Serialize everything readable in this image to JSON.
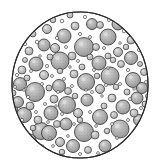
{
  "figure": {
    "kind": "micrograph-illustration",
    "background_color": "#ffffff",
    "canvas": {
      "width": 158,
      "height": 168
    }
  },
  "field": {
    "shape": "circle",
    "center_x": 80,
    "center_y": 85,
    "radius_x": 68,
    "radius_y": 73,
    "outline_color": "#2b2b2b",
    "outline_width": 1.1,
    "fill_color": "#ffffff"
  },
  "particle_style": {
    "fill_light": "#c9c9c9",
    "fill_mid": "#b0b0b0",
    "fill_dark": "#9a9a9a",
    "outline_color": "#3a3a3a",
    "outline_width": 0.8,
    "ring_outline_color": "#4a4a4a",
    "highlight_color": "#e8e8e8",
    "stipple_color": "#7d7d7d"
  },
  "chart_data": {
    "type": "scatter",
    "xlabel": "",
    "ylabel": "",
    "xlim": [
      12,
      150
    ],
    "ylim": [
      12,
      158
    ],
    "grid": false,
    "legend": null,
    "counts": {
      "large": 34,
      "medium": 58,
      "small_rings": 62,
      "total": 154
    },
    "series": [
      {
        "name": "large-particles",
        "shade": "mid",
        "points": [
          {
            "x": 84,
            "y": 47,
            "r": 9.5
          },
          {
            "x": 60,
            "y": 61,
            "r": 9.0
          },
          {
            "x": 110,
            "y": 76,
            "r": 9.0
          },
          {
            "x": 35,
            "y": 92,
            "r": 9.5
          },
          {
            "x": 86,
            "y": 82,
            "r": 8.5
          },
          {
            "x": 84,
            "y": 132,
            "r": 9.5
          },
          {
            "x": 120,
            "y": 129,
            "r": 9.0
          },
          {
            "x": 41,
            "y": 131,
            "r": 8.5
          },
          {
            "x": 108,
            "y": 37,
            "r": 8.0
          },
          {
            "x": 67,
            "y": 105,
            "r": 8.5
          },
          {
            "x": 49,
            "y": 133,
            "r": 7.5
          },
          {
            "x": 100,
            "y": 117,
            "r": 7.5
          },
          {
            "x": 133,
            "y": 80,
            "r": 7.5
          },
          {
            "x": 24,
            "y": 115,
            "r": 7.5
          },
          {
            "x": 99,
            "y": 63,
            "r": 7.0
          },
          {
            "x": 64,
            "y": 36,
            "r": 7.0
          },
          {
            "x": 36,
            "y": 64,
            "r": 7.0
          },
          {
            "x": 123,
            "y": 107,
            "r": 7.0
          },
          {
            "x": 51,
            "y": 113,
            "r": 7.0
          },
          {
            "x": 131,
            "y": 58,
            "r": 6.5
          },
          {
            "x": 20,
            "y": 84,
            "r": 6.5
          },
          {
            "x": 73,
            "y": 146,
            "r": 6.5
          },
          {
            "x": 105,
            "y": 146,
            "r": 6.0
          },
          {
            "x": 59,
            "y": 86,
            "r": 6.5
          },
          {
            "x": 87,
            "y": 100,
            "r": 6.0
          },
          {
            "x": 44,
            "y": 45,
            "r": 6.0
          },
          {
            "x": 118,
            "y": 24,
            "r": 6.0
          },
          {
            "x": 137,
            "y": 98,
            "r": 6.0
          },
          {
            "x": 30,
            "y": 140,
            "r": 6.0
          },
          {
            "x": 142,
            "y": 88,
            "r": 5.5
          },
          {
            "x": 92,
            "y": 24,
            "r": 5.5
          },
          {
            "x": 18,
            "y": 102,
            "r": 5.5
          },
          {
            "x": 66,
            "y": 124,
            "r": 6.0
          },
          {
            "x": 139,
            "y": 120,
            "r": 5.5
          }
        ]
      },
      {
        "name": "medium-particles",
        "shade": "light",
        "points": [
          {
            "x": 47,
            "y": 29,
            "r": 4.5
          },
          {
            "x": 75,
            "y": 26,
            "r": 4.0
          },
          {
            "x": 100,
            "y": 25,
            "r": 3.5
          },
          {
            "x": 131,
            "y": 40,
            "r": 4.0
          },
          {
            "x": 29,
            "y": 51,
            "r": 4.0
          },
          {
            "x": 55,
            "y": 48,
            "r": 4.5
          },
          {
            "x": 72,
            "y": 56,
            "r": 4.0
          },
          {
            "x": 96,
            "y": 47,
            "r": 3.5
          },
          {
            "x": 118,
            "y": 52,
            "r": 4.5
          },
          {
            "x": 22,
            "y": 70,
            "r": 4.0
          },
          {
            "x": 44,
            "y": 75,
            "r": 4.5
          },
          {
            "x": 74,
            "y": 74,
            "r": 4.0
          },
          {
            "x": 100,
            "y": 89,
            "r": 4.5
          },
          {
            "x": 121,
            "y": 64,
            "r": 3.5
          },
          {
            "x": 144,
            "y": 72,
            "r": 3.5
          },
          {
            "x": 30,
            "y": 106,
            "r": 4.0
          },
          {
            "x": 54,
            "y": 99,
            "r": 4.0
          },
          {
            "x": 78,
            "y": 113,
            "r": 4.5
          },
          {
            "x": 112,
            "y": 98,
            "r": 4.0
          },
          {
            "x": 134,
            "y": 113,
            "r": 4.0
          },
          {
            "x": 20,
            "y": 127,
            "r": 4.0
          },
          {
            "x": 57,
            "y": 124,
            "r": 3.5
          },
          {
            "x": 95,
            "y": 135,
            "r": 4.0
          },
          {
            "x": 129,
            "y": 141,
            "r": 4.0
          },
          {
            "x": 60,
            "y": 142,
            "r": 4.5
          },
          {
            "x": 41,
            "y": 148,
            "r": 3.5
          },
          {
            "x": 114,
            "y": 115,
            "r": 3.5
          },
          {
            "x": 90,
            "y": 57,
            "r": 3.0
          },
          {
            "x": 38,
            "y": 120,
            "r": 4.0
          },
          {
            "x": 68,
            "y": 91,
            "r": 3.5
          },
          {
            "x": 108,
            "y": 56,
            "r": 3.0
          },
          {
            "x": 27,
            "y": 78,
            "r": 3.0
          },
          {
            "x": 50,
            "y": 57,
            "r": 3.0
          },
          {
            "x": 82,
            "y": 67,
            "r": 3.0
          },
          {
            "x": 127,
            "y": 92,
            "r": 3.0
          },
          {
            "x": 70,
            "y": 15,
            "r": 3.0
          },
          {
            "x": 145,
            "y": 104,
            "r": 3.0
          },
          {
            "x": 13,
            "y": 93,
            "r": 3.0
          },
          {
            "x": 88,
            "y": 150,
            "r": 3.5
          },
          {
            "x": 113,
            "y": 60,
            "r": 2.8
          },
          {
            "x": 33,
            "y": 34,
            "r": 3.0
          },
          {
            "x": 143,
            "y": 131,
            "r": 3.0
          },
          {
            "x": 49,
            "y": 88,
            "r": 3.0
          },
          {
            "x": 75,
            "y": 96,
            "r": 2.8
          },
          {
            "x": 104,
            "y": 106,
            "r": 3.0
          },
          {
            "x": 60,
            "y": 71,
            "r": 2.8
          },
          {
            "x": 126,
            "y": 47,
            "r": 2.8
          },
          {
            "x": 15,
            "y": 110,
            "r": 2.8
          },
          {
            "x": 53,
            "y": 20,
            "r": 2.8
          },
          {
            "x": 97,
            "y": 76,
            "r": 2.8
          },
          {
            "x": 33,
            "y": 128,
            "r": 2.8
          },
          {
            "x": 116,
            "y": 87,
            "r": 2.8
          },
          {
            "x": 140,
            "y": 64,
            "r": 2.5
          },
          {
            "x": 62,
            "y": 152,
            "r": 2.8
          },
          {
            "x": 25,
            "y": 60,
            "r": 2.5
          },
          {
            "x": 80,
            "y": 120,
            "r": 2.8
          },
          {
            "x": 148,
            "y": 96,
            "r": 2.5
          },
          {
            "x": 107,
            "y": 131,
            "r": 2.8
          }
        ]
      },
      {
        "name": "small-rings",
        "shade": "open",
        "points": [
          {
            "x": 62,
            "y": 21,
            "r": 1.8
          },
          {
            "x": 85,
            "y": 17,
            "r": 1.6
          },
          {
            "x": 109,
            "y": 20,
            "r": 1.6
          },
          {
            "x": 37,
            "y": 42,
            "r": 1.8
          },
          {
            "x": 57,
            "y": 38,
            "r": 1.6
          },
          {
            "x": 80,
            "y": 34,
            "r": 1.6
          },
          {
            "x": 124,
            "y": 31,
            "r": 1.8
          },
          {
            "x": 139,
            "y": 50,
            "r": 1.6
          },
          {
            "x": 25,
            "y": 44,
            "r": 1.6
          },
          {
            "x": 17,
            "y": 75,
            "r": 1.6
          },
          {
            "x": 31,
            "y": 71,
            "r": 1.5
          },
          {
            "x": 47,
            "y": 66,
            "r": 1.6
          },
          {
            "x": 66,
            "y": 47,
            "r": 1.5
          },
          {
            "x": 90,
            "y": 37,
            "r": 1.5
          },
          {
            "x": 104,
            "y": 48,
            "r": 1.5
          },
          {
            "x": 128,
            "y": 70,
            "r": 1.6
          },
          {
            "x": 146,
            "y": 82,
            "r": 1.5
          },
          {
            "x": 15,
            "y": 87,
            "r": 1.5
          },
          {
            "x": 28,
            "y": 97,
            "r": 1.6
          },
          {
            "x": 42,
            "y": 84,
            "r": 1.5
          },
          {
            "x": 52,
            "y": 76,
            "r": 1.5
          },
          {
            "x": 64,
            "y": 79,
            "r": 1.5
          },
          {
            "x": 78,
            "y": 61,
            "r": 1.5
          },
          {
            "x": 94,
            "y": 70,
            "r": 1.5
          },
          {
            "x": 120,
            "y": 84,
            "r": 1.5
          },
          {
            "x": 141,
            "y": 108,
            "r": 1.5
          },
          {
            "x": 22,
            "y": 120,
            "r": 1.6
          },
          {
            "x": 36,
            "y": 112,
            "r": 1.5
          },
          {
            "x": 45,
            "y": 104,
            "r": 1.5
          },
          {
            "x": 58,
            "y": 92,
            "r": 1.5
          },
          {
            "x": 72,
            "y": 86,
            "r": 1.5
          },
          {
            "x": 92,
            "y": 92,
            "r": 1.5
          },
          {
            "x": 106,
            "y": 85,
            "r": 1.5
          },
          {
            "x": 130,
            "y": 99,
            "r": 1.5
          },
          {
            "x": 16,
            "y": 118,
            "r": 1.4
          },
          {
            "x": 27,
            "y": 133,
            "r": 1.5
          },
          {
            "x": 48,
            "y": 122,
            "r": 1.4
          },
          {
            "x": 62,
            "y": 114,
            "r": 1.5
          },
          {
            "x": 74,
            "y": 124,
            "r": 1.4
          },
          {
            "x": 90,
            "y": 112,
            "r": 1.5
          },
          {
            "x": 112,
            "y": 124,
            "r": 1.5
          },
          {
            "x": 128,
            "y": 120,
            "r": 1.5
          },
          {
            "x": 137,
            "y": 130,
            "r": 1.4
          },
          {
            "x": 35,
            "y": 143,
            "r": 1.5
          },
          {
            "x": 53,
            "y": 146,
            "r": 1.4
          },
          {
            "x": 68,
            "y": 136,
            "r": 1.4
          },
          {
            "x": 96,
            "y": 126,
            "r": 1.4
          },
          {
            "x": 117,
            "y": 138,
            "r": 1.4
          },
          {
            "x": 80,
            "y": 154,
            "r": 1.5
          },
          {
            "x": 98,
            "y": 153,
            "r": 1.4
          },
          {
            "x": 115,
            "y": 149,
            "r": 1.4
          },
          {
            "x": 50,
            "y": 138,
            "r": 1.3
          },
          {
            "x": 24,
            "y": 90,
            "r": 1.3
          },
          {
            "x": 40,
            "y": 56,
            "r": 1.3
          },
          {
            "x": 70,
            "y": 67,
            "r": 1.3
          },
          {
            "x": 86,
            "y": 90,
            "r": 1.3
          },
          {
            "x": 102,
            "y": 96,
            "r": 1.3
          },
          {
            "x": 134,
            "y": 89,
            "r": 1.3
          },
          {
            "x": 144,
            "y": 116,
            "r": 1.3
          },
          {
            "x": 56,
            "y": 106,
            "r": 1.3
          },
          {
            "x": 108,
            "y": 68,
            "r": 1.3
          },
          {
            "x": 120,
            "y": 43,
            "r": 1.3
          }
        ]
      }
    ]
  }
}
